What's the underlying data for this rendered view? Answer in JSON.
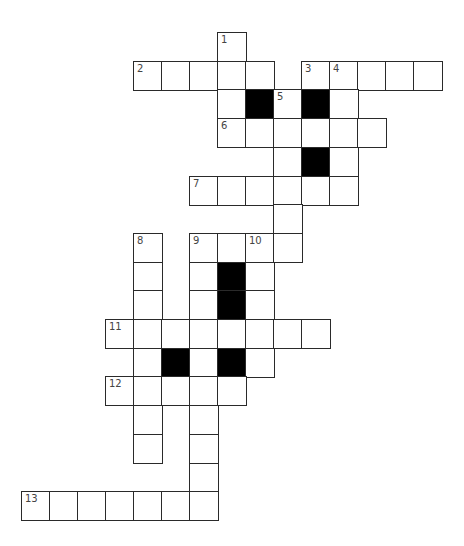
{
  "puzzle": {
    "type": "crossword",
    "grid_origin": {
      "x": 21,
      "y": 32
    },
    "cell_size": {
      "w": 28,
      "h": 28.7
    },
    "colors": {
      "cell": "#ffffff",
      "block": "#000000",
      "border": "#2a2a2a",
      "number": "#444444"
    },
    "cells": [
      {
        "r": 0,
        "c": 7,
        "n": "1"
      },
      {
        "r": 1,
        "c": 4,
        "n": "2"
      },
      {
        "r": 1,
        "c": 5
      },
      {
        "r": 1,
        "c": 6
      },
      {
        "r": 1,
        "c": 7
      },
      {
        "r": 1,
        "c": 8
      },
      {
        "r": 1,
        "c": 10,
        "n": "3"
      },
      {
        "r": 1,
        "c": 11,
        "n": "4"
      },
      {
        "r": 1,
        "c": 12
      },
      {
        "r": 1,
        "c": 13
      },
      {
        "r": 1,
        "c": 14
      },
      {
        "r": 2,
        "c": 7
      },
      {
        "r": 2,
        "c": 8,
        "block": true
      },
      {
        "r": 2,
        "c": 9,
        "n": "5"
      },
      {
        "r": 2,
        "c": 10,
        "block": true
      },
      {
        "r": 2,
        "c": 11
      },
      {
        "r": 3,
        "c": 7,
        "n": "6"
      },
      {
        "r": 3,
        "c": 8
      },
      {
        "r": 3,
        "c": 9
      },
      {
        "r": 3,
        "c": 10
      },
      {
        "r": 3,
        "c": 11
      },
      {
        "r": 3,
        "c": 12
      },
      {
        "r": 4,
        "c": 9
      },
      {
        "r": 4,
        "c": 10,
        "block": true
      },
      {
        "r": 4,
        "c": 11
      },
      {
        "r": 5,
        "c": 6,
        "n": "7"
      },
      {
        "r": 5,
        "c": 7
      },
      {
        "r": 5,
        "c": 8
      },
      {
        "r": 5,
        "c": 9
      },
      {
        "r": 5,
        "c": 10
      },
      {
        "r": 5,
        "c": 11
      },
      {
        "r": 6,
        "c": 9
      },
      {
        "r": 7,
        "c": 4,
        "n": "8"
      },
      {
        "r": 7,
        "c": 6,
        "n": "9"
      },
      {
        "r": 7,
        "c": 7
      },
      {
        "r": 7,
        "c": 8,
        "n": "10"
      },
      {
        "r": 7,
        "c": 9
      },
      {
        "r": 8,
        "c": 4
      },
      {
        "r": 8,
        "c": 6
      },
      {
        "r": 8,
        "c": 7,
        "block": true
      },
      {
        "r": 8,
        "c": 8
      },
      {
        "r": 9,
        "c": 4
      },
      {
        "r": 9,
        "c": 6
      },
      {
        "r": 9,
        "c": 7,
        "block": true
      },
      {
        "r": 9,
        "c": 8
      },
      {
        "r": 10,
        "c": 3,
        "n": "11"
      },
      {
        "r": 10,
        "c": 4
      },
      {
        "r": 10,
        "c": 5
      },
      {
        "r": 10,
        "c": 6
      },
      {
        "r": 10,
        "c": 7
      },
      {
        "r": 10,
        "c": 8
      },
      {
        "r": 10,
        "c": 9
      },
      {
        "r": 10,
        "c": 10
      },
      {
        "r": 11,
        "c": 4
      },
      {
        "r": 11,
        "c": 5,
        "block": true
      },
      {
        "r": 11,
        "c": 6
      },
      {
        "r": 11,
        "c": 7,
        "block": true
      },
      {
        "r": 11,
        "c": 8
      },
      {
        "r": 12,
        "c": 3,
        "n": "12"
      },
      {
        "r": 12,
        "c": 4
      },
      {
        "r": 12,
        "c": 5
      },
      {
        "r": 12,
        "c": 6
      },
      {
        "r": 12,
        "c": 7
      },
      {
        "r": 13,
        "c": 4
      },
      {
        "r": 13,
        "c": 6
      },
      {
        "r": 14,
        "c": 4
      },
      {
        "r": 14,
        "c": 6
      },
      {
        "r": 15,
        "c": 6
      },
      {
        "r": 16,
        "c": 0,
        "n": "13"
      },
      {
        "r": 16,
        "c": 1
      },
      {
        "r": 16,
        "c": 2
      },
      {
        "r": 16,
        "c": 3
      },
      {
        "r": 16,
        "c": 4
      },
      {
        "r": 16,
        "c": 5
      },
      {
        "r": 16,
        "c": 6
      }
    ]
  }
}
